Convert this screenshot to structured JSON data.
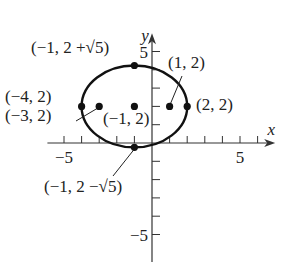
{
  "chart_data": {
    "type": "scatter",
    "title": "",
    "xlabel": "x",
    "ylabel": "y",
    "xlim": [
      -6,
      7
    ],
    "ylim": [
      -6.5,
      6
    ],
    "x_ticks": [
      -5,
      -4,
      -3,
      -2,
      -1,
      1,
      2,
      3,
      4,
      5,
      6
    ],
    "y_ticks": [
      -5,
      -4,
      -3,
      -2,
      -1,
      1,
      2,
      3,
      4,
      5
    ],
    "x_tick_labels": [
      {
        "value": -5,
        "label": "−5"
      },
      {
        "value": 5,
        "label": "5"
      }
    ],
    "y_tick_labels": [
      {
        "value": 5,
        "label": "5"
      },
      {
        "value": -5,
        "label": "−5"
      }
    ],
    "ellipse": {
      "center": [
        -1,
        2
      ],
      "semi_axis_x": 3,
      "semi_axis_y": 2.2360679775,
      "equation": "(x+1)^2/9 + (y-2)^2/5 = 1"
    },
    "points": [
      {
        "name": "vertex-left",
        "x": -4,
        "y": 2,
        "label": "(−4, 2)"
      },
      {
        "name": "focus-left",
        "x": -3,
        "y": 2,
        "label": "(−3, 2)"
      },
      {
        "name": "center",
        "x": -1,
        "y": 2,
        "label": "(−1, 2)"
      },
      {
        "name": "focus-right",
        "x": 1,
        "y": 2,
        "label": "(1, 2)"
      },
      {
        "name": "vertex-right",
        "x": 2,
        "y": 2,
        "label": "(2, 2)"
      },
      {
        "name": "covertex-top",
        "x": -1,
        "y": 4.2360679775,
        "label": "(−1, 2 +√5)"
      },
      {
        "name": "covertex-bottom",
        "x": -1,
        "y": -0.2360679775,
        "label": "(−1, 2 −√5)"
      }
    ],
    "grid": false,
    "legend": "none"
  }
}
